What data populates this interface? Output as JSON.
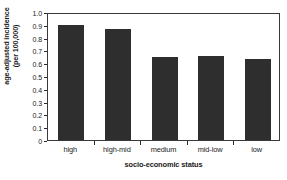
{
  "chart_data": {
    "type": "bar",
    "title": "",
    "subtitle": "",
    "categories": [
      "high",
      "high-mid",
      "medium",
      "mid-low",
      "low"
    ],
    "values": [
      0.9,
      0.87,
      0.645,
      0.66,
      0.63
    ],
    "series": [
      {
        "name": "age-adjusted incidence",
        "values": [
          0.9,
          0.87,
          0.645,
          0.66,
          0.63
        ]
      }
    ],
    "xlabel": "socio-economic status",
    "ylabel": "age-adjusted incidence (per 100,000)",
    "ylabel_line1": "age-adjusted incidence",
    "ylabel_line2": "(per 100,000)",
    "ylim": [
      0,
      1.0
    ],
    "ytick_step": 0.1,
    "ytick_labels": [
      "1.0",
      "0.9",
      "0.8",
      "0.7",
      "0.6",
      "0.5",
      "0.4",
      "0.3",
      "0.2",
      "0.1",
      "0"
    ],
    "ytick_values": [
      1.0,
      0.9,
      0.8,
      0.7,
      0.6,
      0.5,
      0.4,
      0.3,
      0.2,
      0.1,
      0
    ],
    "grid": false,
    "legend": false,
    "legend_position": "none",
    "bar_color": "#2e2e2e",
    "frame_color": "#3a3a3a",
    "background_color": "#ffffff",
    "annotations": []
  },
  "figure": {
    "name": "age-adjusted-incidence-by-socio-economic-status"
  }
}
